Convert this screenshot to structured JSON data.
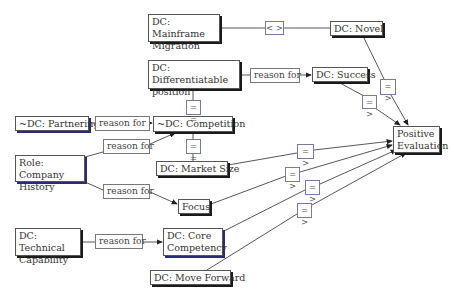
{
  "diagram": {
    "type": "conceptual-graph",
    "nodes": {
      "mainframe": "DC: Mainframe Migration",
      "novel": "DC: Novel",
      "differentiatable": "DC: Differentiatable position",
      "success": "DC: Success",
      "partnering": "~DC: Partnering",
      "competition": "~DC: Competition",
      "positive": "Positive Evaluation",
      "role_history": "Role: Company History",
      "market_size": "DC: Market Size",
      "focus": "Focus",
      "technical": "DC: Technical Capability",
      "core": "DC: Core Competency",
      "move_forward": "DC: Move Forward"
    },
    "relations": {
      "not_equal": "< >",
      "reason_for": "reason for",
      "equals": "= =",
      "implies": "= >"
    },
    "edges": [
      {
        "from": "DC: Mainframe Migration",
        "rel": "< >",
        "to": "DC: Novel"
      },
      {
        "from": "DC: Differentiatable position",
        "rel": "reason for",
        "to": "DC: Success"
      },
      {
        "from": "DC: Differentiatable position",
        "rel": "= =",
        "to": "~DC: Competition"
      },
      {
        "from": "~DC: Partnering",
        "rel": "reason for",
        "to": "~DC: Competition"
      },
      {
        "from": "Role: Company History",
        "rel": "reason for",
        "to": "~DC: Competition"
      },
      {
        "from": "~DC: Competition",
        "rel": "= =",
        "to": "DC: Market Size"
      },
      {
        "from": "Role: Company History",
        "rel": "reason for",
        "to": "Focus"
      },
      {
        "from": "DC: Technical Capability",
        "rel": "reason for",
        "to": "DC: Core Competency"
      },
      {
        "from": "DC: Novel",
        "rel": "= >",
        "to": "Positive Evaluation"
      },
      {
        "from": "DC: Success",
        "rel": "= >",
        "to": "Positive Evaluation"
      },
      {
        "from": "DC: Market Size",
        "rel": "= >",
        "to": "Positive Evaluation"
      },
      {
        "from": "Focus",
        "rel": "= >",
        "to": "Positive Evaluation"
      },
      {
        "from": "DC: Core Competency",
        "rel": "= >",
        "to": "Positive Evaluation"
      },
      {
        "from": "DC: Move Forward",
        "rel": "= >",
        "to": "Positive Evaluation"
      }
    ],
    "colors": {
      "line": "#333333",
      "shadow": "#1a1a1a",
      "shadow_blue": "#2a2a7a"
    }
  }
}
